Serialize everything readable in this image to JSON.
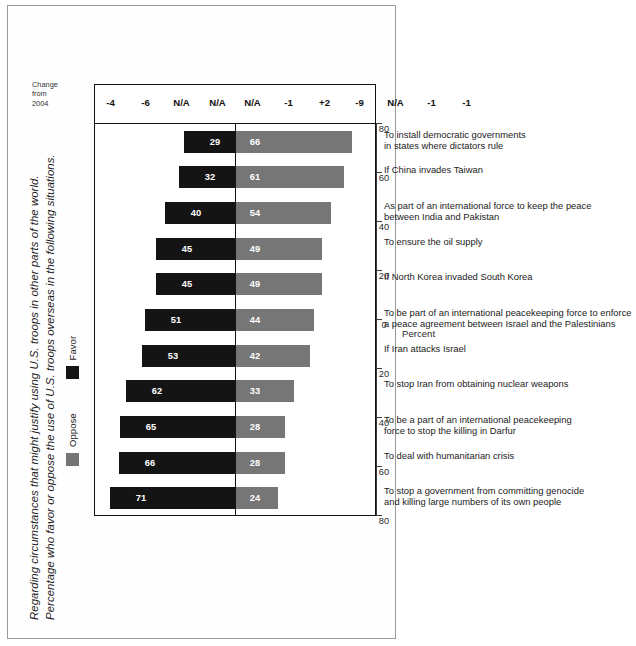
{
  "figure": {
    "title_line1": "Regarding circumstances that might justify using U.S. troops in other parts of the world.",
    "title_line2": "Percentage who favor or oppose the use of U.S. troops overseas in the following situations."
  },
  "legend": {
    "oppose_label": "Oppose",
    "favor_label": "Favor",
    "oppose_color": "#767676",
    "favor_color": "#141414"
  },
  "change_column": {
    "header": "Change\nfrom\n2004"
  },
  "axis": {
    "title": "Percent",
    "tick_labels": [
      "80",
      "60",
      "40",
      "20",
      "0",
      "20",
      "40",
      "60",
      "80"
    ]
  },
  "chart_data": {
    "type": "bar",
    "title": "Regarding circumstances that might justify using U.S. troops in other parts of the world. Percentage who favor or oppose the use of U.S. troops overseas in the following situations.",
    "xlabel": "",
    "ylabel": "Percent",
    "orientation": "diverging-vertical",
    "ylim": [
      -80,
      80
    ],
    "grid": false,
    "legend_position": "top-left",
    "categories": [
      "To stop a government from committing genocide and killing large numbers of its own people",
      "To deal with humanitarian crisis",
      "To be a part of an international peacekeeping force to stop the killing in Darfur",
      "To stop Iran from obtaining nuclear weapons",
      "If Iran attacks Israel",
      "To be part of an international peacekeeping force to enforce a peace agreement between Israel and the Palestinians",
      "If North Korea invaded South Korea",
      "To ensure the oil supply",
      "As part of an international force to keep the peace between India and Pakistan",
      "If China invades Taiwan",
      "To install democratic governments in states where dictators rule"
    ],
    "category_lines": [
      "To stop a government from committing genocide\nand killing large numbers of its own people",
      "To deal with humanitarian crisis",
      "To be a part of an international peacekeeping\nforce to stop the killing in Darfur",
      "To stop Iran from obtaining nuclear weapons",
      "If Iran attacks Israel",
      "To be part of an international peacekeeping force to enforce\na peace agreement between Israel and the Palestinians",
      "If North Korea invaded South Korea",
      "To ensure the oil supply",
      "As part of an international force to keep the peace\nbetween India and Pakistan",
      "If China invades Taiwan",
      "To install democratic governments\nin states where dictators rule"
    ],
    "series": [
      {
        "name": "Favor",
        "values": [
          71,
          66,
          65,
          62,
          53,
          51,
          45,
          45,
          40,
          32,
          29
        ]
      },
      {
        "name": "Oppose",
        "values": [
          24,
          28,
          28,
          33,
          42,
          44,
          49,
          49,
          54,
          61,
          66
        ]
      }
    ],
    "change_from_2004": [
      "-4",
      "-6",
      "N/A",
      "N/A",
      "N/A",
      "-1",
      "+2",
      "-9",
      "N/A",
      "-1",
      "-1"
    ]
  }
}
